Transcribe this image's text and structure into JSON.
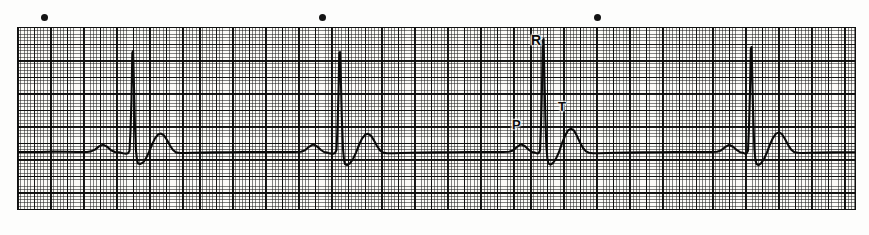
{
  "document": {
    "title": "ECG Rhythm Strip",
    "background_color": "#fdfdfc",
    "paper_color": "#fbfaf7",
    "trace_color": "#0a0a0a",
    "grid_fine_color": "#1e1e1e",
    "grid_bold_color": "#080808"
  },
  "paper": {
    "x": 17,
    "y": 27,
    "width": 839,
    "height": 183,
    "fine_square_px": 3.31,
    "bold_square_px": 16.55,
    "baseline_y": 125,
    "border_color": "#101010"
  },
  "markers": {
    "name": "calibration-dot-markers",
    "color": "#141414",
    "diameter_px": 7,
    "y": 14,
    "x_positions": [
      41,
      319,
      594
    ]
  },
  "labels": [
    {
      "text": "P",
      "name": "p-wave-label",
      "x": 512,
      "y": 118,
      "size": 13
    },
    {
      "text": "R",
      "name": "r-wave-label",
      "x": 531,
      "y": 33,
      "size": 14
    },
    {
      "text": "T",
      "name": "t-wave-label",
      "x": 558,
      "y": 100,
      "size": 13
    }
  ],
  "chart_data": {
    "type": "line",
    "subtitle": "Single-lead electrocardiogram tracing on standard graph paper",
    "xlabel": "Time",
    "ylabel": "Amplitude",
    "grid": true,
    "legend": "none",
    "paper_speed": "25 mm/s",
    "gain": "10 mm/mV",
    "beat_count": 4,
    "annotations": [
      "P",
      "R",
      "T"
    ],
    "series": [
      {
        "name": "ECG lead trace",
        "color": "#0a0a0a",
        "stroke_width": 2.1,
        "points": [
          [
            0,
            125
          ],
          [
            12,
            125
          ],
          [
            24,
            125
          ],
          [
            36,
            124.6
          ],
          [
            48,
            124.8
          ],
          [
            60,
            125
          ],
          [
            70,
            125
          ],
          [
            74,
            124.4
          ],
          [
            78,
            122.6
          ],
          [
            82,
            119.4
          ],
          [
            86,
            117.6
          ],
          [
            90,
            119.6
          ],
          [
            94,
            123.2
          ],
          [
            98,
            125
          ],
          [
            102,
            125.4
          ],
          [
            106,
            126.2
          ],
          [
            109,
            126.6
          ],
          [
            111,
            126.2
          ],
          [
            112.5,
            124
          ],
          [
            113.5,
            104
          ],
          [
            114.5,
            72
          ],
          [
            115.3,
            26
          ],
          [
            116.1,
            24
          ],
          [
            117,
            60
          ],
          [
            118,
            100
          ],
          [
            119,
            124
          ],
          [
            120,
            133
          ],
          [
            121,
            136.4
          ],
          [
            123,
            137
          ],
          [
            126,
            135.6
          ],
          [
            129,
            131.4
          ],
          [
            132,
            125
          ],
          [
            135,
            117.6
          ],
          [
            138,
            111.4
          ],
          [
            141,
            107.6
          ],
          [
            144,
            106.6
          ],
          [
            147,
            108.4
          ],
          [
            150,
            113
          ],
          [
            153,
            118.6
          ],
          [
            156,
            123
          ],
          [
            159,
            125.4
          ],
          [
            163,
            126
          ],
          [
            168,
            126
          ],
          [
            176,
            125.8
          ],
          [
            186,
            125.6
          ],
          [
            198,
            125.4
          ],
          [
            212,
            125.2
          ],
          [
            226,
            125
          ],
          [
            240,
            125
          ],
          [
            255,
            125
          ],
          [
            268,
            125
          ],
          [
            278,
            125
          ],
          [
            284,
            124.8
          ],
          [
            288,
            123.2
          ],
          [
            292,
            119.8
          ],
          [
            296,
            117.4
          ],
          [
            300,
            119.4
          ],
          [
            304,
            123
          ],
          [
            307,
            125
          ],
          [
            310,
            125.6
          ],
          [
            313,
            126.4
          ],
          [
            316,
            126.8
          ],
          [
            318,
            126
          ],
          [
            319.5,
            123
          ],
          [
            320.5,
            100
          ],
          [
            321.5,
            66
          ],
          [
            322.3,
            26
          ],
          [
            323.1,
            25
          ],
          [
            324,
            58
          ],
          [
            325,
            96
          ],
          [
            326,
            122
          ],
          [
            327,
            133
          ],
          [
            328,
            137
          ],
          [
            330,
            138
          ],
          [
            333,
            136.4
          ],
          [
            336,
            132
          ],
          [
            339,
            125.6
          ],
          [
            342,
            118
          ],
          [
            345,
            111.6
          ],
          [
            348,
            107.8
          ],
          [
            351,
            106.8
          ],
          [
            354,
            108.6
          ],
          [
            357,
            113.4
          ],
          [
            360,
            119
          ],
          [
            363,
            123.4
          ],
          [
            366,
            125.6
          ],
          [
            370,
            126.2
          ],
          [
            376,
            126.2
          ],
          [
            384,
            126
          ],
          [
            394,
            125.8
          ],
          [
            406,
            125.6
          ],
          [
            420,
            125.4
          ],
          [
            436,
            125.2
          ],
          [
            452,
            125
          ],
          [
            466,
            125
          ],
          [
            478,
            125
          ],
          [
            486,
            125
          ],
          [
            492,
            124.8
          ],
          [
            496,
            123.4
          ],
          [
            500,
            120
          ],
          [
            504,
            117.2
          ],
          [
            508,
            119.2
          ],
          [
            512,
            123
          ],
          [
            515,
            125
          ],
          [
            518,
            125.6
          ],
          [
            520,
            126.4
          ],
          [
            521.5,
            126.2
          ],
          [
            523,
            123.6
          ],
          [
            524,
            98
          ],
          [
            525,
            60
          ],
          [
            525.8,
            14
          ],
          [
            526.6,
            12
          ],
          [
            527.4,
            50
          ],
          [
            528.4,
            92
          ],
          [
            529.4,
            120
          ],
          [
            530.4,
            132
          ],
          [
            531.5,
            136.6
          ],
          [
            533.5,
            137.6
          ],
          [
            536,
            136
          ],
          [
            539,
            131.6
          ],
          [
            542,
            125
          ],
          [
            545,
            116.4
          ],
          [
            548,
            108.8
          ],
          [
            551,
            103.4
          ],
          [
            554,
            101.6
          ],
          [
            557,
            103.6
          ],
          [
            560,
            109
          ],
          [
            563,
            115.6
          ],
          [
            566,
            121
          ],
          [
            569,
            124.4
          ],
          [
            572,
            125.8
          ],
          [
            576,
            126.2
          ],
          [
            582,
            126.2
          ],
          [
            590,
            126
          ],
          [
            600,
            125.8
          ],
          [
            612,
            125.6
          ],
          [
            626,
            125.4
          ],
          [
            642,
            125.2
          ],
          [
            658,
            125
          ],
          [
            672,
            125
          ],
          [
            684,
            125
          ],
          [
            694,
            125
          ],
          [
            700,
            124.8
          ],
          [
            704,
            123.4
          ],
          [
            708,
            120.2
          ],
          [
            712,
            117.8
          ],
          [
            716,
            119.8
          ],
          [
            720,
            123.2
          ],
          [
            723,
            125.2
          ],
          [
            726,
            125.8
          ],
          [
            728,
            126.6
          ],
          [
            729.5,
            126.4
          ],
          [
            731,
            123.8
          ],
          [
            732,
            100
          ],
          [
            733,
            64
          ],
          [
            733.8,
            22
          ],
          [
            734.6,
            20
          ],
          [
            735.4,
            56
          ],
          [
            736.4,
            96
          ],
          [
            737.4,
            122
          ],
          [
            738.4,
            133
          ],
          [
            739.5,
            137
          ],
          [
            741.5,
            138
          ],
          [
            744,
            136.4
          ],
          [
            747,
            132
          ],
          [
            750,
            125.4
          ],
          [
            753,
            117.4
          ],
          [
            756,
            110.8
          ],
          [
            759,
            106.6
          ],
          [
            762,
            105.4
          ],
          [
            765,
            107.2
          ],
          [
            768,
            112
          ],
          [
            771,
            117.8
          ],
          [
            774,
            122.4
          ],
          [
            777,
            125
          ],
          [
            781,
            125.8
          ],
          [
            786,
            126
          ],
          [
            794,
            125.8
          ],
          [
            804,
            125.6
          ],
          [
            816,
            125.4
          ],
          [
            828,
            125.2
          ],
          [
            839,
            125.2
          ]
        ]
      }
    ]
  }
}
